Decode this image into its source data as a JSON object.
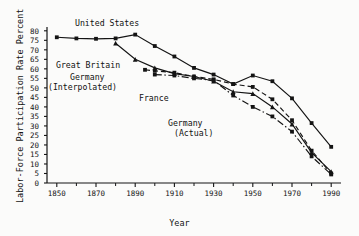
{
  "chart_data": {
    "type": "line",
    "title": "",
    "xlabel": "Year",
    "ylabel": "Labor-Force Participation Rate Percent",
    "xlim": [
      1845,
      1995
    ],
    "ylim": [
      0,
      82
    ],
    "yticks": [
      0,
      5,
      10,
      15,
      20,
      25,
      30,
      35,
      40,
      45,
      50,
      55,
      60,
      65,
      70,
      75,
      80
    ],
    "xticks": [
      1850,
      1870,
      1890,
      1910,
      1930,
      1950,
      1970,
      1990
    ],
    "xminor": [
      1860,
      1880,
      1900,
      1920,
      1940,
      1960,
      1980
    ],
    "grid": false,
    "legend_position": "inline-annotations",
    "series": [
      {
        "name": "United States",
        "style": "solid",
        "marker": "square",
        "x": [
          1850,
          1860,
          1870,
          1880,
          1890,
          1900,
          1910,
          1920,
          1930,
          1940,
          1950,
          1960,
          1970,
          1980,
          1990
        ],
        "values": [
          76.6,
          76.0,
          75.8,
          76.0,
          78.0,
          72.0,
          66.5,
          60.5,
          57.0,
          52.0,
          56.5,
          53.5,
          44.5,
          31.5,
          19.0
        ]
      },
      {
        "name": "Great Britain",
        "style": "solid",
        "marker": "triangle",
        "x": [
          1880,
          1890,
          1900,
          1910,
          1920,
          1930,
          1940,
          1950,
          1960,
          1970,
          1980,
          1990
        ],
        "values": [
          73.5,
          65.0,
          60.5,
          57.5,
          56.0,
          53.5,
          48.0,
          47.0,
          40.0,
          31.0,
          16.0,
          6.0
        ]
      },
      {
        "name": "Germany (Interpolated)",
        "style": "dashed",
        "marker": "square",
        "x": [
          1895,
          1900,
          1910,
          1920,
          1930,
          1940,
          1950,
          1960,
          1970,
          1980,
          1990
        ],
        "values": [
          59.5,
          59.0,
          58.0,
          56.0,
          54.5,
          52.0,
          50.5,
          44.0,
          33.0,
          17.0,
          5.0
        ]
      },
      {
        "name": "France",
        "style": "dash-dot",
        "marker": "square",
        "x": [
          1900,
          1910,
          1920,
          1930,
          1940,
          1950,
          1960,
          1970,
          1980,
          1990
        ],
        "values": [
          57.0,
          56.5,
          55.0,
          54.0,
          46.0,
          40.0,
          35.0,
          27.0,
          14.0,
          4.5
        ]
      }
    ],
    "annotations": [
      {
        "id": "united-states",
        "text": "United States",
        "x": 75,
        "y": 20
      },
      {
        "id": "great-britain",
        "text": "Great Britain",
        "x": 56,
        "y": 61
      },
      {
        "id": "germany-interpolated",
        "text": "Germany\n(Interpolated)",
        "x": 62,
        "y": 74
      },
      {
        "id": "france",
        "text": "France",
        "x": 139,
        "y": 94
      },
      {
        "id": "germany-actual",
        "text": "Germany\n(Actual)",
        "x": 170,
        "y": 118
      }
    ]
  },
  "axis": {
    "y_title": "Labor-Force Participation Rate Percent",
    "x_title": "Year",
    "y_tick_labels": [
      "80",
      "75",
      "70",
      "65",
      "60",
      "55",
      "50",
      "45",
      "40",
      "35",
      "30",
      "25",
      "20",
      "15",
      "10",
      "5",
      "0"
    ],
    "x_tick_labels": [
      "1850",
      "1870",
      "1890",
      "1910",
      "1930",
      "1950",
      "1970",
      "1990"
    ]
  },
  "annotation_text": {
    "united_states": "United States",
    "great_britain": "Great Britain",
    "germany_interpolated_1": "Germany",
    "germany_interpolated_2": "(Interpolated)",
    "france": "France",
    "germany_actual_1": "Germany",
    "germany_actual_2": "(Actual)"
  },
  "colors": {
    "ink": "#141414",
    "background": "#fbfbfa"
  }
}
